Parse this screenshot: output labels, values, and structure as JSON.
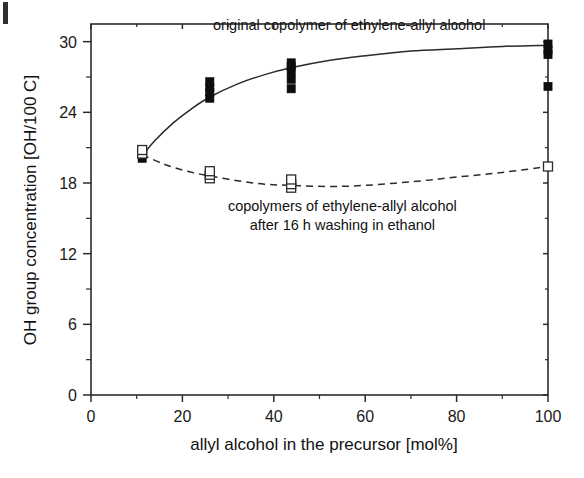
{
  "figure": {
    "corner_mark": "scan-artifact"
  },
  "chart_data": {
    "type": "scatter",
    "title": "",
    "xlabel": "allyl alcohol in the precursor [mol%]",
    "ylabel": "OH group concentration [OH/100 C]",
    "xlim": [
      0,
      100
    ],
    "ylim": [
      0,
      31.5
    ],
    "xticks": [
      0,
      20,
      40,
      60,
      80,
      100
    ],
    "xtick_labels": [
      "0",
      "20",
      "40",
      "60",
      "80",
      "100"
    ],
    "xticks_minor": [
      10,
      30,
      50,
      70,
      90
    ],
    "yticks": [
      0,
      6,
      12,
      18,
      24,
      30
    ],
    "ytick_labels": [
      "0",
      "6",
      "12",
      "18",
      "24",
      "30"
    ],
    "yticks_minor": [
      3,
      9,
      15,
      21,
      27
    ],
    "grid": false,
    "legend_position": "inline-annotations",
    "series": [
      {
        "name": "original copolymer of ethylene-allyl alcohol",
        "marker": "filled-square",
        "fit_style": "solid",
        "points": [
          {
            "x": 11.2,
            "y": 20.1
          },
          {
            "x": 11.2,
            "y": 20.4
          },
          {
            "x": 26.0,
            "y": 25.2
          },
          {
            "x": 26.0,
            "y": 25.7
          },
          {
            "x": 26.0,
            "y": 26.1
          },
          {
            "x": 26.0,
            "y": 26.6
          },
          {
            "x": 43.8,
            "y": 26.0
          },
          {
            "x": 43.8,
            "y": 26.8
          },
          {
            "x": 43.8,
            "y": 27.5
          },
          {
            "x": 43.8,
            "y": 27.9
          },
          {
            "x": 43.8,
            "y": 28.2
          },
          {
            "x": 100.0,
            "y": 26.2
          },
          {
            "x": 100.0,
            "y": 28.9
          },
          {
            "x": 100.0,
            "y": 29.3
          },
          {
            "x": 100.0,
            "y": 29.8
          }
        ],
        "fit_curve": [
          {
            "x": 11.2,
            "y": 20.3
          },
          {
            "x": 14.0,
            "y": 21.6
          },
          {
            "x": 18.0,
            "y": 23.1
          },
          {
            "x": 22.0,
            "y": 24.3
          },
          {
            "x": 26.0,
            "y": 25.3
          },
          {
            "x": 32.0,
            "y": 26.4
          },
          {
            "x": 38.0,
            "y": 27.2
          },
          {
            "x": 44.0,
            "y": 27.8
          },
          {
            "x": 52.0,
            "y": 28.4
          },
          {
            "x": 60.0,
            "y": 28.8
          },
          {
            "x": 70.0,
            "y": 29.2
          },
          {
            "x": 80.0,
            "y": 29.4
          },
          {
            "x": 90.0,
            "y": 29.6
          },
          {
            "x": 100.0,
            "y": 29.7
          }
        ]
      },
      {
        "name": "copolymers of ethylene-allyl alcohol after 16 h washing in ethanol",
        "marker": "open-square",
        "fit_style": "dashed",
        "points": [
          {
            "x": 11.2,
            "y": 20.5
          },
          {
            "x": 11.2,
            "y": 20.8
          },
          {
            "x": 26.0,
            "y": 18.4
          },
          {
            "x": 26.0,
            "y": 18.7
          },
          {
            "x": 26.0,
            "y": 19.0
          },
          {
            "x": 43.8,
            "y": 17.6
          },
          {
            "x": 43.8,
            "y": 17.9
          },
          {
            "x": 43.8,
            "y": 18.3
          },
          {
            "x": 100.0,
            "y": 19.4
          }
        ],
        "fit_curve": [
          {
            "x": 11.2,
            "y": 20.4
          },
          {
            "x": 16.0,
            "y": 19.6
          },
          {
            "x": 21.0,
            "y": 19.0
          },
          {
            "x": 26.0,
            "y": 18.6
          },
          {
            "x": 32.0,
            "y": 18.2
          },
          {
            "x": 38.0,
            "y": 17.9
          },
          {
            "x": 44.0,
            "y": 17.8
          },
          {
            "x": 52.0,
            "y": 17.7
          },
          {
            "x": 60.0,
            "y": 17.8
          },
          {
            "x": 70.0,
            "y": 18.1
          },
          {
            "x": 80.0,
            "y": 18.5
          },
          {
            "x": 90.0,
            "y": 18.9
          },
          {
            "x": 100.0,
            "y": 19.4
          }
        ]
      }
    ],
    "annotations": [
      {
        "id": "upper",
        "lines": [
          "original copolymer of ethylene-allyl alcohol"
        ],
        "x": 56.5,
        "y": 31.0
      },
      {
        "id": "lower",
        "lines": [
          "copolymers of ethylene-allyl alcohol",
          "after 16 h washing in ethanol"
        ],
        "x": 55.0,
        "y": 15.6
      }
    ]
  },
  "colors": {
    "axis": "#2b2b2b",
    "filled_marker": "#0d0d0d",
    "open_marker_fill": "#ffffff",
    "background": "#ffffff"
  }
}
